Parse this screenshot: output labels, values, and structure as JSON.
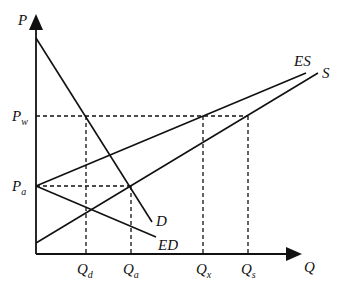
{
  "diagram": {
    "type": "supply-demand-trade",
    "axes": {
      "y_label": "P",
      "x_label": "Q"
    },
    "price_levels": [
      {
        "id": "Pw",
        "main": "P",
        "sub": "w",
        "y": 116
      },
      {
        "id": "Pa",
        "main": "P",
        "sub": "a",
        "y": 186
      }
    ],
    "quantity_levels": [
      {
        "id": "Qd",
        "main": "Q",
        "sub": "d",
        "x": 86
      },
      {
        "id": "Qa",
        "main": "Q",
        "sub": "a",
        "x": 131
      },
      {
        "id": "Qx",
        "main": "Q",
        "sub": "x",
        "x": 203
      },
      {
        "id": "Qs",
        "main": "Q",
        "sub": "s",
        "x": 248
      }
    ],
    "curves": [
      {
        "id": "D",
        "label": "D",
        "x1": 36,
        "y1": 38,
        "x2": 152,
        "y2": 222
      },
      {
        "id": "S",
        "label": "S",
        "x1": 36,
        "y1": 243,
        "x2": 318,
        "y2": 73
      },
      {
        "id": "ES",
        "label": "ES",
        "x1": 36,
        "y1": 186,
        "x2": 306,
        "y2": 73
      },
      {
        "id": "ED",
        "label": "ED",
        "x1": 36,
        "y1": 186,
        "x2": 156,
        "y2": 237
      }
    ],
    "colors": {
      "line": "#111111",
      "background": "#ffffff"
    }
  }
}
